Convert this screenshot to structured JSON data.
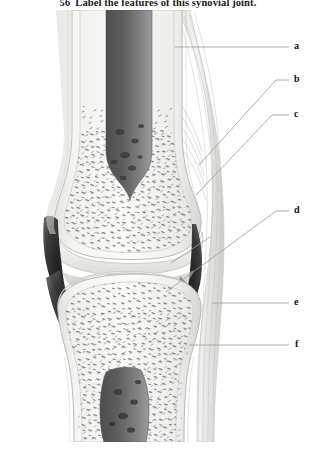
{
  "exercise": {
    "number": "56",
    "instruction": "Label the features of this synovial joint.",
    "full_title": "56  Label the features of this synovial joint."
  },
  "figure": {
    "colors": {
      "background": "#ffffff",
      "bone_light": "#f2f2f0",
      "bone_outline": "#b8b8b4",
      "compact_bone": "#e4e4e1",
      "spongy_bone": "#f6f6f4",
      "trabeculae": "#6e6e6e",
      "marrow_cavity_dark": "#5a5a5a",
      "joint_cavity": "#2b2b2b",
      "capsule": "#e9e9e6",
      "leader_line": "#9a9a9a",
      "label_text": "#111111",
      "title_text": "#1a1a1a"
    }
  },
  "labels": [
    {
      "id": "a",
      "letter": "a",
      "answer_blank": true
    },
    {
      "id": "b",
      "letter": "b",
      "answer_blank": true
    },
    {
      "id": "c",
      "letter": "c",
      "answer_blank": true
    },
    {
      "id": "d",
      "letter": "d",
      "answer_blank": true
    },
    {
      "id": "e",
      "letter": "e",
      "answer_blank": true
    },
    {
      "id": "f",
      "letter": "f",
      "answer_blank": true
    }
  ]
}
